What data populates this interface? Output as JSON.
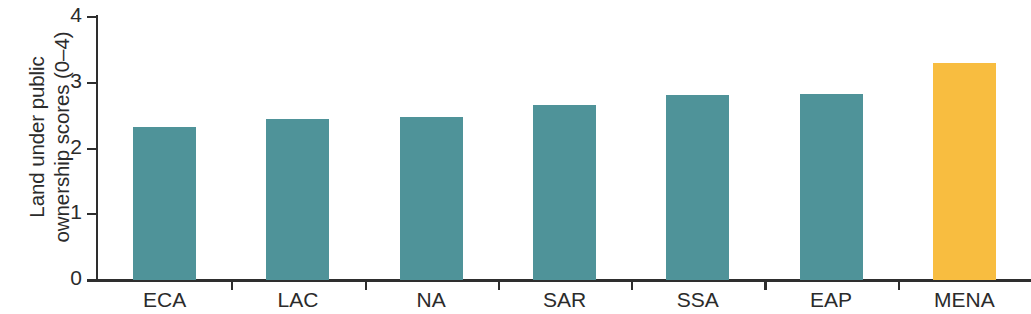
{
  "chart_data": {
    "type": "bar",
    "title": "",
    "xlabel": "",
    "ylabel": "Land under public ownership scores (0–4)",
    "ylabel_line1": "Land under public",
    "ylabel_line2": "ownership scores (0–4)",
    "categories": [
      "ECA",
      "LAC",
      "NA",
      "SAR",
      "SSA",
      "EAP",
      "MENA"
    ],
    "values": [
      2.33,
      2.45,
      2.48,
      2.66,
      2.81,
      2.83,
      3.3
    ],
    "ylim": [
      0,
      4
    ],
    "yticks": [
      0,
      1,
      2,
      3,
      4
    ],
    "ytick_labels": [
      "0",
      "1",
      "2",
      "3",
      "4"
    ],
    "grid": false,
    "legend": null,
    "bar_colors": [
      "#4f9399",
      "#4f9399",
      "#4f9399",
      "#4f9399",
      "#4f9399",
      "#4f9399",
      "#f8bd40"
    ],
    "colors": {
      "teal": "#4f9399",
      "orange": "#f8bd40",
      "axis": "#2e2e2e",
      "text": "#2b2b2b",
      "background": "#ffffff"
    }
  }
}
